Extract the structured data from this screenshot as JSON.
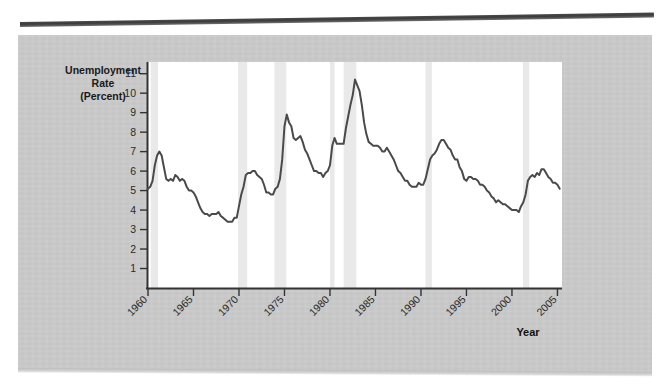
{
  "figure": {
    "background_color": "#c9c9c9",
    "plot_background_color": "#ffffff",
    "line_color": "#4a4a4a",
    "recession_band_color": "#e9e9e9"
  },
  "labels": {
    "y_axis_line1": "Unemployment",
    "y_axis_line2": "Rate",
    "y_axis_line3": "(Percent)",
    "x_axis_title": "Year"
  },
  "chart_data": {
    "type": "line",
    "title": "",
    "xlabel": "Year",
    "ylabel": "Unemployment Rate (Percent)",
    "xlim": [
      1960,
      2005.5
    ],
    "ylim": [
      0,
      11.6
    ],
    "yticks": [
      1,
      2,
      3,
      4,
      5,
      6,
      7,
      8,
      9,
      10,
      11
    ],
    "ytick_labels": [
      "1",
      "2",
      "3",
      "4",
      "5",
      "6",
      "7",
      "8",
      "9",
      "10",
      "11"
    ],
    "xticks": [
      1960,
      1965,
      1970,
      1975,
      1980,
      1985,
      1990,
      1995,
      2000,
      2005
    ],
    "xtick_labels": [
      "1960",
      "1965",
      "1970",
      "1975",
      "1980",
      "1985",
      "1990",
      "1995",
      "2000",
      "2005"
    ],
    "xtick_rotation": 45,
    "grid": false,
    "legend": "none",
    "series": [
      {
        "name": "Civilian Unemployment Rate",
        "x": [
          1960.0,
          1960.25,
          1960.5,
          1960.75,
          1961.0,
          1961.25,
          1961.5,
          1961.75,
          1962.0,
          1962.25,
          1962.5,
          1962.75,
          1963.0,
          1963.25,
          1963.5,
          1963.75,
          1964.0,
          1964.25,
          1964.5,
          1964.75,
          1965.0,
          1965.25,
          1965.5,
          1965.75,
          1966.0,
          1966.25,
          1966.5,
          1966.75,
          1967.0,
          1967.25,
          1967.5,
          1967.75,
          1968.0,
          1968.25,
          1968.5,
          1968.75,
          1969.0,
          1969.25,
          1969.5,
          1969.75,
          1970.0,
          1970.25,
          1970.5,
          1970.75,
          1971.0,
          1971.25,
          1971.5,
          1971.75,
          1972.0,
          1972.25,
          1972.5,
          1972.75,
          1973.0,
          1973.25,
          1973.5,
          1973.75,
          1974.0,
          1974.25,
          1974.5,
          1974.75,
          1975.0,
          1975.25,
          1975.5,
          1975.75,
          1976.0,
          1976.25,
          1976.5,
          1976.75,
          1977.0,
          1977.25,
          1977.5,
          1977.75,
          1978.0,
          1978.25,
          1978.5,
          1978.75,
          1979.0,
          1979.25,
          1979.5,
          1979.75,
          1980.0,
          1980.25,
          1980.5,
          1980.75,
          1981.0,
          1981.25,
          1981.5,
          1981.75,
          1982.0,
          1982.25,
          1982.5,
          1982.75,
          1983.0,
          1983.25,
          1983.5,
          1983.75,
          1984.0,
          1984.25,
          1984.5,
          1984.75,
          1985.0,
          1985.25,
          1985.5,
          1985.75,
          1986.0,
          1986.25,
          1986.5,
          1986.75,
          1987.0,
          1987.25,
          1987.5,
          1987.75,
          1988.0,
          1988.25,
          1988.5,
          1988.75,
          1989.0,
          1989.25,
          1989.5,
          1989.75,
          1990.0,
          1990.25,
          1990.5,
          1990.75,
          1991.0,
          1991.25,
          1991.5,
          1991.75,
          1992.0,
          1992.25,
          1992.5,
          1992.75,
          1993.0,
          1993.25,
          1993.5,
          1993.75,
          1994.0,
          1994.25,
          1994.5,
          1994.75,
          1995.0,
          1995.25,
          1995.5,
          1995.75,
          1996.0,
          1996.25,
          1996.5,
          1996.75,
          1997.0,
          1997.25,
          1997.5,
          1997.75,
          1998.0,
          1998.25,
          1998.5,
          1998.75,
          1999.0,
          1999.25,
          1999.5,
          1999.75,
          2000.0,
          2000.25,
          2000.5,
          2000.75,
          2001.0,
          2001.25,
          2001.5,
          2001.75,
          2002.0,
          2002.25,
          2002.5,
          2002.75,
          2003.0,
          2003.25,
          2003.5,
          2003.75,
          2004.0,
          2004.25,
          2004.5,
          2004.75,
          2005.0,
          2005.25
        ],
        "y": [
          5.1,
          5.2,
          5.5,
          6.3,
          6.8,
          7.0,
          6.8,
          6.2,
          5.6,
          5.5,
          5.6,
          5.5,
          5.8,
          5.7,
          5.5,
          5.6,
          5.5,
          5.2,
          5.0,
          5.0,
          4.9,
          4.7,
          4.4,
          4.1,
          3.9,
          3.8,
          3.8,
          3.7,
          3.8,
          3.8,
          3.8,
          3.9,
          3.7,
          3.6,
          3.5,
          3.4,
          3.4,
          3.4,
          3.6,
          3.6,
          4.2,
          4.8,
          5.2,
          5.8,
          5.9,
          5.9,
          6.0,
          6.0,
          5.8,
          5.7,
          5.6,
          5.3,
          4.9,
          4.9,
          4.8,
          4.8,
          5.1,
          5.2,
          5.6,
          6.6,
          8.3,
          8.9,
          8.5,
          8.3,
          7.7,
          7.6,
          7.7,
          7.8,
          7.5,
          7.1,
          6.9,
          6.6,
          6.3,
          6.0,
          6.0,
          5.9,
          5.9,
          5.7,
          5.9,
          6.0,
          6.3,
          7.3,
          7.7,
          7.4,
          7.4,
          7.4,
          7.4,
          8.2,
          8.8,
          9.4,
          9.9,
          10.7,
          10.4,
          10.1,
          9.4,
          8.5,
          7.9,
          7.5,
          7.4,
          7.3,
          7.3,
          7.3,
          7.2,
          7.0,
          7.0,
          7.2,
          7.0,
          6.8,
          6.6,
          6.3,
          6.0,
          5.9,
          5.7,
          5.5,
          5.5,
          5.3,
          5.2,
          5.2,
          5.2,
          5.4,
          5.3,
          5.3,
          5.6,
          6.1,
          6.6,
          6.8,
          6.9,
          7.1,
          7.4,
          7.6,
          7.6,
          7.4,
          7.2,
          7.1,
          6.8,
          6.6,
          6.6,
          6.2,
          6.0,
          5.6,
          5.5,
          5.7,
          5.7,
          5.6,
          5.6,
          5.5,
          5.3,
          5.3,
          5.2,
          5.0,
          4.9,
          4.7,
          4.6,
          4.4,
          4.5,
          4.4,
          4.3,
          4.3,
          4.2,
          4.1,
          4.0,
          4.0,
          4.0,
          3.9,
          4.2,
          4.4,
          4.8,
          5.5,
          5.7,
          5.8,
          5.7,
          5.9,
          5.8,
          6.1,
          6.1,
          5.9,
          5.7,
          5.6,
          5.4,
          5.4,
          5.3,
          5.1
        ]
      }
    ],
    "recession_bands": [
      {
        "start": 1960.3,
        "end": 1961.1
      },
      {
        "start": 1969.9,
        "end": 1970.9
      },
      {
        "start": 1973.9,
        "end": 1975.2
      },
      {
        "start": 1980.0,
        "end": 1980.5
      },
      {
        "start": 1981.5,
        "end": 1982.9
      },
      {
        "start": 1990.5,
        "end": 1991.2
      },
      {
        "start": 2001.2,
        "end": 2001.9
      }
    ]
  }
}
